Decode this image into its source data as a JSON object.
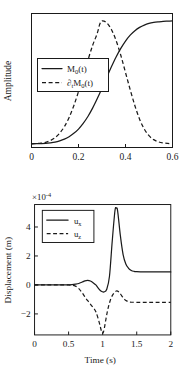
{
  "figure": {
    "background": "#ffffff",
    "ink_color": "#1a1a1a"
  },
  "chart_data": [
    {
      "id": "source-time-function",
      "type": "line",
      "title": "",
      "xlabel": "",
      "ylabel": "Amplitude",
      "xlim": [
        0,
        0.6
      ],
      "ylim": [
        -0.03,
        1.06
      ],
      "xticks": [
        0,
        0.2,
        0.4,
        0.6
      ],
      "xticklabels": [
        "0",
        "0.2",
        "0.4",
        "0.6"
      ],
      "yticks": [],
      "yticklabels": [],
      "grid": false,
      "legend_position": "center-left",
      "series": [
        {
          "name": "M_0(t)",
          "label_main": "M",
          "label_sub": "0",
          "label_tail": "(t)",
          "style": "solid",
          "x": [
            0,
            0.02,
            0.04,
            0.06,
            0.08,
            0.1,
            0.12,
            0.14,
            0.16,
            0.18,
            0.2,
            0.22,
            0.24,
            0.26,
            0.28,
            0.3,
            0.32,
            0.34,
            0.36,
            0.38,
            0.4,
            0.42,
            0.44,
            0.46,
            0.48,
            0.5,
            0.52,
            0.54,
            0.56,
            0.58,
            0.6
          ],
          "y": [
            0,
            0.001,
            0.002,
            0.004,
            0.008,
            0.014,
            0.024,
            0.038,
            0.058,
            0.085,
            0.12,
            0.166,
            0.222,
            0.29,
            0.368,
            0.452,
            0.54,
            0.626,
            0.706,
            0.776,
            0.836,
            0.884,
            0.92,
            0.947,
            0.966,
            0.979,
            0.987,
            0.992,
            0.996,
            0.998,
            1.0
          ]
        },
        {
          "name": "d_t M_0(t)",
          "label_main": "M",
          "label_sub": "0",
          "label_tail": "(t)",
          "label_prefix": "∂",
          "label_prefix_sub": "t",
          "style": "dashed",
          "x": [
            0,
            0.02,
            0.04,
            0.06,
            0.08,
            0.1,
            0.12,
            0.14,
            0.16,
            0.18,
            0.2,
            0.22,
            0.24,
            0.26,
            0.28,
            0.29,
            0.3,
            0.32,
            0.34,
            0.36,
            0.38,
            0.4,
            0.42,
            0.44,
            0.46,
            0.48,
            0.5,
            0.52,
            0.54,
            0.56,
            0.58,
            0.6
          ],
          "y": [
            0,
            0.002,
            0.005,
            0.012,
            0.026,
            0.05,
            0.087,
            0.14,
            0.214,
            0.31,
            0.425,
            0.552,
            0.68,
            0.8,
            0.9,
            0.97,
            1.0,
            0.985,
            0.93,
            0.84,
            0.72,
            0.58,
            0.44,
            0.31,
            0.2,
            0.12,
            0.066,
            0.034,
            0.016,
            0.007,
            0.003,
            0.001
          ]
        }
      ]
    },
    {
      "id": "displacement-seismogram",
      "type": "line",
      "title": "",
      "xlabel": "Time (s)",
      "ylabel": "Displacement (m)",
      "exponent_label": "×10",
      "exponent_value": "-4",
      "xlim": [
        0,
        2
      ],
      "ylim": [
        -3.45,
        5.55
      ],
      "xticks": [
        0,
        0.5,
        1,
        1.5,
        2
      ],
      "xticklabels": [
        "0",
        "0.5",
        "1",
        "1.5",
        "2"
      ],
      "yticks": [
        -2,
        0,
        2,
        4
      ],
      "yticklabels": [
        "−2",
        "0",
        "2",
        "4"
      ],
      "grid": false,
      "legend_position": "upper-left",
      "series": [
        {
          "name": "u_x",
          "label_main": "u",
          "label_sub": "x",
          "style": "solid",
          "x": [
            0,
            0.1,
            0.2,
            0.3,
            0.4,
            0.5,
            0.55,
            0.6,
            0.65,
            0.7,
            0.74,
            0.78,
            0.82,
            0.86,
            0.9,
            0.94,
            0.98,
            1.02,
            1.06,
            1.1,
            1.14,
            1.18,
            1.2,
            1.22,
            1.26,
            1.3,
            1.34,
            1.38,
            1.42,
            1.46,
            1.5,
            1.6,
            1.7,
            1.8,
            1.9,
            2.0
          ],
          "y": [
            0,
            0,
            0,
            0,
            0,
            0.01,
            0.02,
            0.05,
            0.1,
            0.2,
            0.28,
            0.31,
            0.27,
            0.15,
            0.0,
            -0.25,
            -0.44,
            -0.48,
            -0.3,
            0.6,
            3.0,
            5.1,
            5.3,
            5.1,
            3.4,
            2.1,
            1.45,
            1.15,
            1.0,
            0.94,
            0.92,
            0.9,
            0.9,
            0.9,
            0.9,
            0.9
          ]
        },
        {
          "name": "u_z",
          "label_main": "u",
          "label_sub": "z",
          "style": "dashed",
          "x": [
            0,
            0.1,
            0.2,
            0.3,
            0.4,
            0.5,
            0.55,
            0.6,
            0.65,
            0.7,
            0.75,
            0.8,
            0.85,
            0.9,
            0.95,
            0.98,
            1.0,
            1.02,
            1.05,
            1.08,
            1.12,
            1.16,
            1.2,
            1.24,
            1.28,
            1.32,
            1.36,
            1.4,
            1.5,
            1.6,
            1.7,
            1.8,
            1.9,
            2.0
          ],
          "y": [
            0,
            0,
            0,
            0,
            0,
            0,
            -0.02,
            -0.08,
            -0.25,
            -0.55,
            -0.9,
            -1.2,
            -1.5,
            -1.85,
            -2.6,
            -3.15,
            -3.35,
            -3.1,
            -2.3,
            -1.6,
            -0.95,
            -0.6,
            -0.42,
            -0.5,
            -0.75,
            -1.0,
            -1.12,
            -1.18,
            -1.2,
            -1.2,
            -1.2,
            -1.2,
            -1.2,
            -1.2
          ]
        }
      ]
    }
  ]
}
